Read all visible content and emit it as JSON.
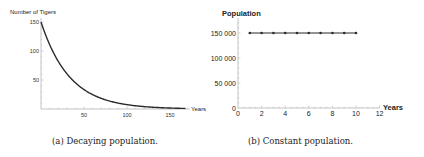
{
  "captions": {
    "a": "(a) Decaying population.",
    "b": "(b) Constant population."
  },
  "chart_data": [
    {
      "type": "line",
      "title": "",
      "xlabel": "Years",
      "ylabel": "Number of Tigers",
      "xlim": [
        0,
        170
      ],
      "ylim": [
        0,
        155
      ],
      "xticks": [
        50,
        100,
        150
      ],
      "yticks": [
        50,
        100,
        150
      ],
      "grid": false,
      "series": [
        {
          "name": "decay",
          "description": "exponential decay N(t)=150*exp(-0.03t)",
          "x": [
            0,
            10,
            20,
            30,
            40,
            50,
            60,
            70,
            80,
            90,
            100,
            110,
            120,
            130,
            140,
            150,
            160,
            168
          ],
          "y": [
            150,
            111,
            82,
            61,
            45,
            33,
            25,
            18,
            14,
            10,
            7.5,
            5.5,
            4.1,
            3.0,
            2.2,
            1.7,
            1.2,
            1.0
          ]
        }
      ]
    },
    {
      "type": "line",
      "title": "",
      "xlabel": "Years",
      "ylabel": "Population",
      "xlim": [
        0,
        12
      ],
      "ylim": [
        0,
        180000
      ],
      "xticks": [
        0,
        2,
        4,
        6,
        8,
        10,
        12
      ],
      "yticks": [
        0,
        50000,
        100000,
        150000
      ],
      "ytick_labels": [
        "0",
        "50 000",
        "100 000",
        "150 000"
      ],
      "grid": false,
      "series": [
        {
          "name": "constant",
          "markers": true,
          "x": [
            1,
            2,
            3,
            4,
            5,
            6,
            7,
            8,
            9,
            10
          ],
          "y": [
            150000,
            150000,
            150000,
            150000,
            150000,
            150000,
            150000,
            150000,
            150000,
            150000
          ]
        }
      ]
    }
  ]
}
